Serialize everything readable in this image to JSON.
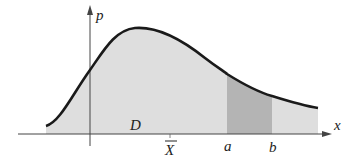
{
  "diagram": {
    "axes": {
      "y_label": "p",
      "x_label": "x"
    },
    "labels": {
      "region": "D",
      "mean": "X",
      "a": "a",
      "b": "b"
    },
    "colors": {
      "curve": "#1a1a1a",
      "fill_region": "#dedede",
      "fill_interval": "#b4b4b4",
      "axis": "#444444"
    }
  }
}
